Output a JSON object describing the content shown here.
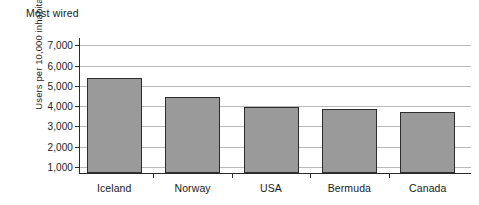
{
  "chart_data": {
    "type": "bar",
    "title": "Most wired",
    "xlabel": "",
    "ylabel": "Users per 10,000 inhabitants",
    "categories": [
      "Iceland",
      "Norway",
      "USA",
      "Bermuda",
      "Canada"
    ],
    "values": [
      5380,
      4460,
      3950,
      3880,
      3690
    ],
    "ylim": [
      1000,
      7000
    ],
    "yticks": [
      1000,
      2000,
      3000,
      4000,
      5000,
      6000,
      7000
    ],
    "ytick_labels": [
      "1,000",
      "2,000",
      "3,000",
      "4,000",
      "5,000",
      "6,000",
      "7,000"
    ],
    "grid": true,
    "legend": "none",
    "series": [
      {
        "name": "Users per 10,000 inhabitants",
        "values": [
          5380,
          4460,
          3950,
          3880,
          3690
        ]
      }
    ],
    "colors": {
      "bar_fill": "#9a9a9a",
      "bar_stroke": "#2d2d2d",
      "gridline": "#b9b9b9",
      "axis": "#2b2b2b",
      "text": "#1a1a1a",
      "background": "#ffffff"
    }
  }
}
